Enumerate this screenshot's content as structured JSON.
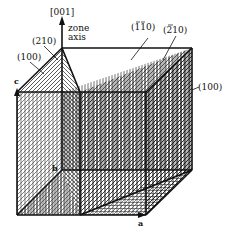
{
  "figure": {
    "type": "crystallographic zone diagram",
    "zone_axis": {
      "direction_label": "[001]",
      "caption_line1": "zone",
      "caption_line2": "axis"
    },
    "plane_labels": [
      {
        "id": "plane-100-left",
        "text": "(100)"
      },
      {
        "id": "plane-210",
        "text": "(210)"
      },
      {
        "id": "plane-bar110",
        "text": "(̅1̅1 0)",
        "display": "(110)",
        "overbars": [
          0,
          1
        ]
      },
      {
        "id": "plane-bar210",
        "text": "(̅2 10)",
        "display": "(210)",
        "overbars": [
          0
        ]
      },
      {
        "id": "plane-100-right",
        "text": "(100)"
      }
    ],
    "axes": {
      "a": "a",
      "b": "b",
      "c": "c"
    },
    "colors": {
      "line": "#111111",
      "background": "#ffffff"
    }
  }
}
